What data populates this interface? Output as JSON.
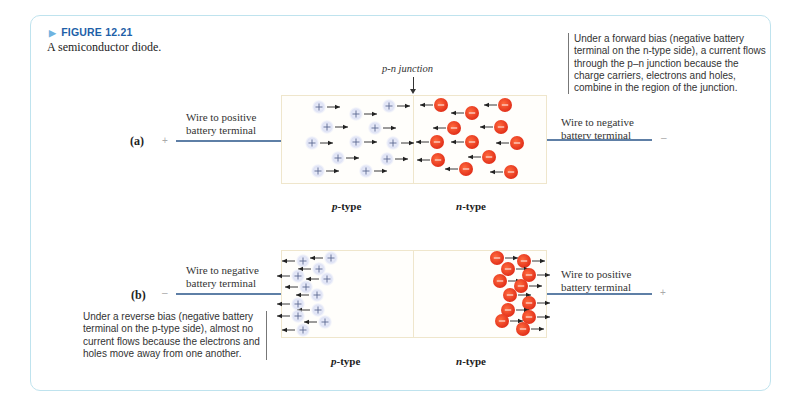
{
  "figure": {
    "label": "FIGURE 12.21",
    "caption": "A semiconductor diode."
  },
  "colors": {
    "frame_border": "#bfe3ee",
    "figure_label": "#1e5fa8",
    "wire": "#5e7fa6",
    "electron": "#e8381e",
    "hole": "#dfe3f5",
    "box_border": "#efe6cc"
  },
  "junction_label": "p-n junction",
  "part_a": {
    "label": "(a)",
    "left_terminal": "+",
    "right_terminal": "–",
    "left_wire_label_line1": "Wire to positive",
    "left_wire_label_line2": "battery terminal",
    "right_wire_label_line1": "Wire to negative",
    "right_wire_label_line2": "battery terminal",
    "p_type_label": "p",
    "n_type_label": "n",
    "type_suffix": "-type",
    "note": "Under a forward bias (negative battery terminal on the n-type side), a current flows through the p–n junction because the charge carriers, electrons and holes, combine in the region of the junction.",
    "hole_direction": "right",
    "electron_direction": "left"
  },
  "part_b": {
    "label": "(b)",
    "left_terminal": "–",
    "right_terminal": "+",
    "left_wire_label_line1": "Wire to negative",
    "left_wire_label_line2": "battery terminal",
    "right_wire_label_line1": "Wire to positive",
    "right_wire_label_line2": "battery terminal",
    "p_type_label": "p",
    "n_type_label": "n",
    "type_suffix": "-type",
    "note": "Under a reverse bias (negative battery terminal on the p-type side), almost no current flows because the electrons and holes move away from one another.",
    "hole_direction": "left",
    "electron_direction": "right"
  },
  "particles": {
    "a_holes": [
      [
        319,
        107
      ],
      [
        356,
        114
      ],
      [
        389,
        106
      ],
      [
        327,
        127
      ],
      [
        375,
        128
      ],
      [
        312,
        143
      ],
      [
        356,
        142
      ],
      [
        393,
        143
      ],
      [
        338,
        158
      ],
      [
        387,
        159
      ],
      [
        318,
        171
      ],
      [
        366,
        171
      ]
    ],
    "a_electrons": [
      [
        441,
        105
      ],
      [
        472,
        113
      ],
      [
        505,
        105
      ],
      [
        454,
        128
      ],
      [
        501,
        127
      ],
      [
        437,
        142
      ],
      [
        472,
        142
      ],
      [
        517,
        143
      ],
      [
        489,
        157
      ],
      [
        438,
        160
      ],
      [
        466,
        169
      ],
      [
        511,
        172
      ]
    ],
    "b_holes": [
      [
        303,
        261
      ],
      [
        331,
        258
      ],
      [
        319,
        269
      ],
      [
        298,
        276
      ],
      [
        327,
        279
      ],
      [
        306,
        287
      ],
      [
        317,
        295
      ],
      [
        298,
        304
      ],
      [
        318,
        310
      ],
      [
        298,
        316
      ],
      [
        325,
        322
      ],
      [
        303,
        330
      ]
    ],
    "b_electrons": [
      [
        497,
        258
      ],
      [
        524,
        261
      ],
      [
        508,
        269
      ],
      [
        529,
        275
      ],
      [
        500,
        281
      ],
      [
        521,
        286
      ],
      [
        510,
        295
      ],
      [
        529,
        303
      ],
      [
        508,
        310
      ],
      [
        529,
        317
      ],
      [
        502,
        321
      ],
      [
        523,
        329
      ]
    ]
  }
}
